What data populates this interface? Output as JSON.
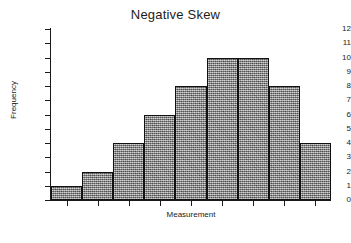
{
  "chart_data": {
    "type": "bar",
    "title": "Negative Skew",
    "xlabel": "Measurement",
    "ylabel": "Frequency",
    "categories": [
      "1",
      "2",
      "3",
      "4",
      "5",
      "6",
      "7",
      "8",
      "9"
    ],
    "values": [
      1,
      2,
      4,
      6,
      8,
      10,
      10,
      8,
      4
    ],
    "ylim": [
      0,
      12
    ],
    "yticks": [
      0,
      1,
      2,
      3,
      4,
      5,
      6,
      7,
      8,
      9,
      10,
      11,
      12
    ],
    "ytick_labels": [
      "0",
      "1",
      "2",
      "3",
      "4",
      "5",
      "6",
      "7",
      "8",
      "9",
      "10",
      "11",
      "12"
    ],
    "xtick_labels": [
      "",
      "",
      "",
      "",
      "",
      "",
      "",
      "",
      ""
    ],
    "grid": false,
    "legend": null,
    "bar_style": {
      "fill": "#8e8e8e",
      "pattern": "stippled-grey",
      "edge_color": "#111111",
      "contiguous": true
    },
    "axis_color": "#1a1a1a",
    "background": "#ffffff"
  }
}
